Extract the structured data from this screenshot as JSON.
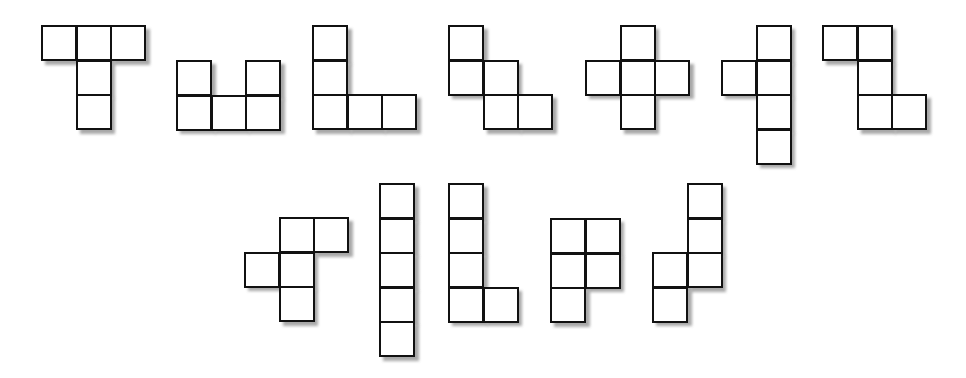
{
  "diagram": {
    "title": "",
    "cell_size": 34.6,
    "line_color": "#111111",
    "fill_color": "#ffffff",
    "shadow_color": "#9a9a9a",
    "pieces": [
      {
        "name": "T",
        "x": 41,
        "y": 25,
        "cells": [
          [
            0,
            0
          ],
          [
            1,
            0
          ],
          [
            2,
            0
          ],
          [
            1,
            1
          ],
          [
            1,
            2
          ]
        ]
      },
      {
        "name": "U",
        "x": 176,
        "y": 60,
        "cells": [
          [
            0,
            0
          ],
          [
            2,
            0
          ],
          [
            0,
            1
          ],
          [
            1,
            1
          ],
          [
            2,
            1
          ]
        ]
      },
      {
        "name": "V",
        "x": 312,
        "y": 25,
        "cells": [
          [
            0,
            0
          ],
          [
            0,
            1
          ],
          [
            0,
            2
          ],
          [
            1,
            2
          ],
          [
            2,
            2
          ]
        ]
      },
      {
        "name": "W",
        "x": 448,
        "y": 25,
        "cells": [
          [
            0,
            0
          ],
          [
            0,
            1
          ],
          [
            1,
            1
          ],
          [
            1,
            2
          ],
          [
            2,
            2
          ]
        ]
      },
      {
        "name": "X",
        "x": 585,
        "y": 25,
        "cells": [
          [
            1,
            0
          ],
          [
            0,
            1
          ],
          [
            1,
            1
          ],
          [
            2,
            1
          ],
          [
            1,
            2
          ]
        ]
      },
      {
        "name": "Y",
        "x": 721,
        "y": 25,
        "cells": [
          [
            1,
            0
          ],
          [
            0,
            1
          ],
          [
            1,
            1
          ],
          [
            1,
            2
          ],
          [
            1,
            3
          ]
        ]
      },
      {
        "name": "Z",
        "x": 822,
        "y": 25,
        "cells": [
          [
            0,
            0
          ],
          [
            1,
            0
          ],
          [
            1,
            1
          ],
          [
            1,
            2
          ],
          [
            2,
            2
          ]
        ]
      },
      {
        "name": "F",
        "x": 244,
        "y": 217,
        "cells": [
          [
            1,
            0
          ],
          [
            2,
            0
          ],
          [
            0,
            1
          ],
          [
            1,
            1
          ],
          [
            1,
            2
          ]
        ]
      },
      {
        "name": "I",
        "x": 379,
        "y": 183,
        "cells": [
          [
            0,
            0
          ],
          [
            0,
            1
          ],
          [
            0,
            2
          ],
          [
            0,
            3
          ],
          [
            0,
            4
          ]
        ]
      },
      {
        "name": "L",
        "x": 448,
        "y": 183,
        "cells": [
          [
            0,
            0
          ],
          [
            0,
            1
          ],
          [
            0,
            2
          ],
          [
            0,
            3
          ],
          [
            1,
            3
          ]
        ]
      },
      {
        "name": "P",
        "x": 550,
        "y": 218,
        "cells": [
          [
            0,
            0
          ],
          [
            1,
            0
          ],
          [
            0,
            1
          ],
          [
            1,
            1
          ],
          [
            0,
            2
          ]
        ]
      },
      {
        "name": "N",
        "x": 652,
        "y": 183,
        "cells": [
          [
            1,
            0
          ],
          [
            1,
            1
          ],
          [
            0,
            2
          ],
          [
            1,
            2
          ],
          [
            0,
            3
          ]
        ]
      }
    ]
  }
}
